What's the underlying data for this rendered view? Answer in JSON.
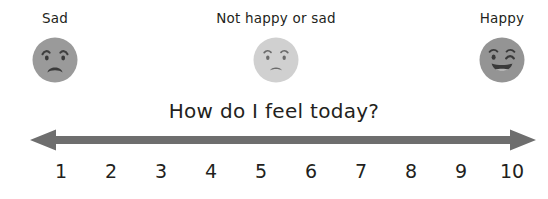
{
  "title": "How do I feel today?",
  "anchors": [
    {
      "label": "Sad",
      "x": 55,
      "face": "sad-face",
      "face_color": "#9a9a9a"
    },
    {
      "label": "Not happy or sad",
      "x": 276,
      "face": "neutral-face",
      "face_color": "#d0d0d0"
    },
    {
      "label": "Happy",
      "x": 502,
      "face": "happy-face",
      "face_color": "#949494"
    }
  ],
  "scale": {
    "numbers": [
      "1",
      "2",
      "3",
      "4",
      "5",
      "6",
      "7",
      "8",
      "9",
      "10"
    ],
    "min": 1,
    "max": 10,
    "arrow": "double-headed-arrow",
    "arrow_color": "#6e6e6e"
  },
  "colors": {
    "background": "#ffffff",
    "text": "#231f20",
    "arrow": "#6e6e6e",
    "face_dark": "#9a9a9a",
    "face_light": "#d0d0d0",
    "feature": "#3a3a3a"
  }
}
